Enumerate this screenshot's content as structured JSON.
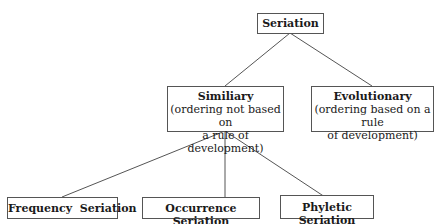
{
  "diagram": {
    "root": {
      "title": "Seriation"
    },
    "level1": [
      {
        "title": "Similiary",
        "subtitle_line1": "(ordering not based on",
        "subtitle_line2": "a rule of development)"
      },
      {
        "title": "Evolutionary",
        "subtitle_line1": "(ordering based on a rule",
        "subtitle_line2": "of development)"
      }
    ],
    "level2": [
      {
        "title": "Frequency  Seriation"
      },
      {
        "title": "Occurrence Seriation"
      },
      {
        "title": "Phyletic Seriation"
      }
    ],
    "colors": {
      "line": "#555555",
      "border": "#555555",
      "text": "#1a1a1a",
      "background": "#ffffff"
    }
  }
}
